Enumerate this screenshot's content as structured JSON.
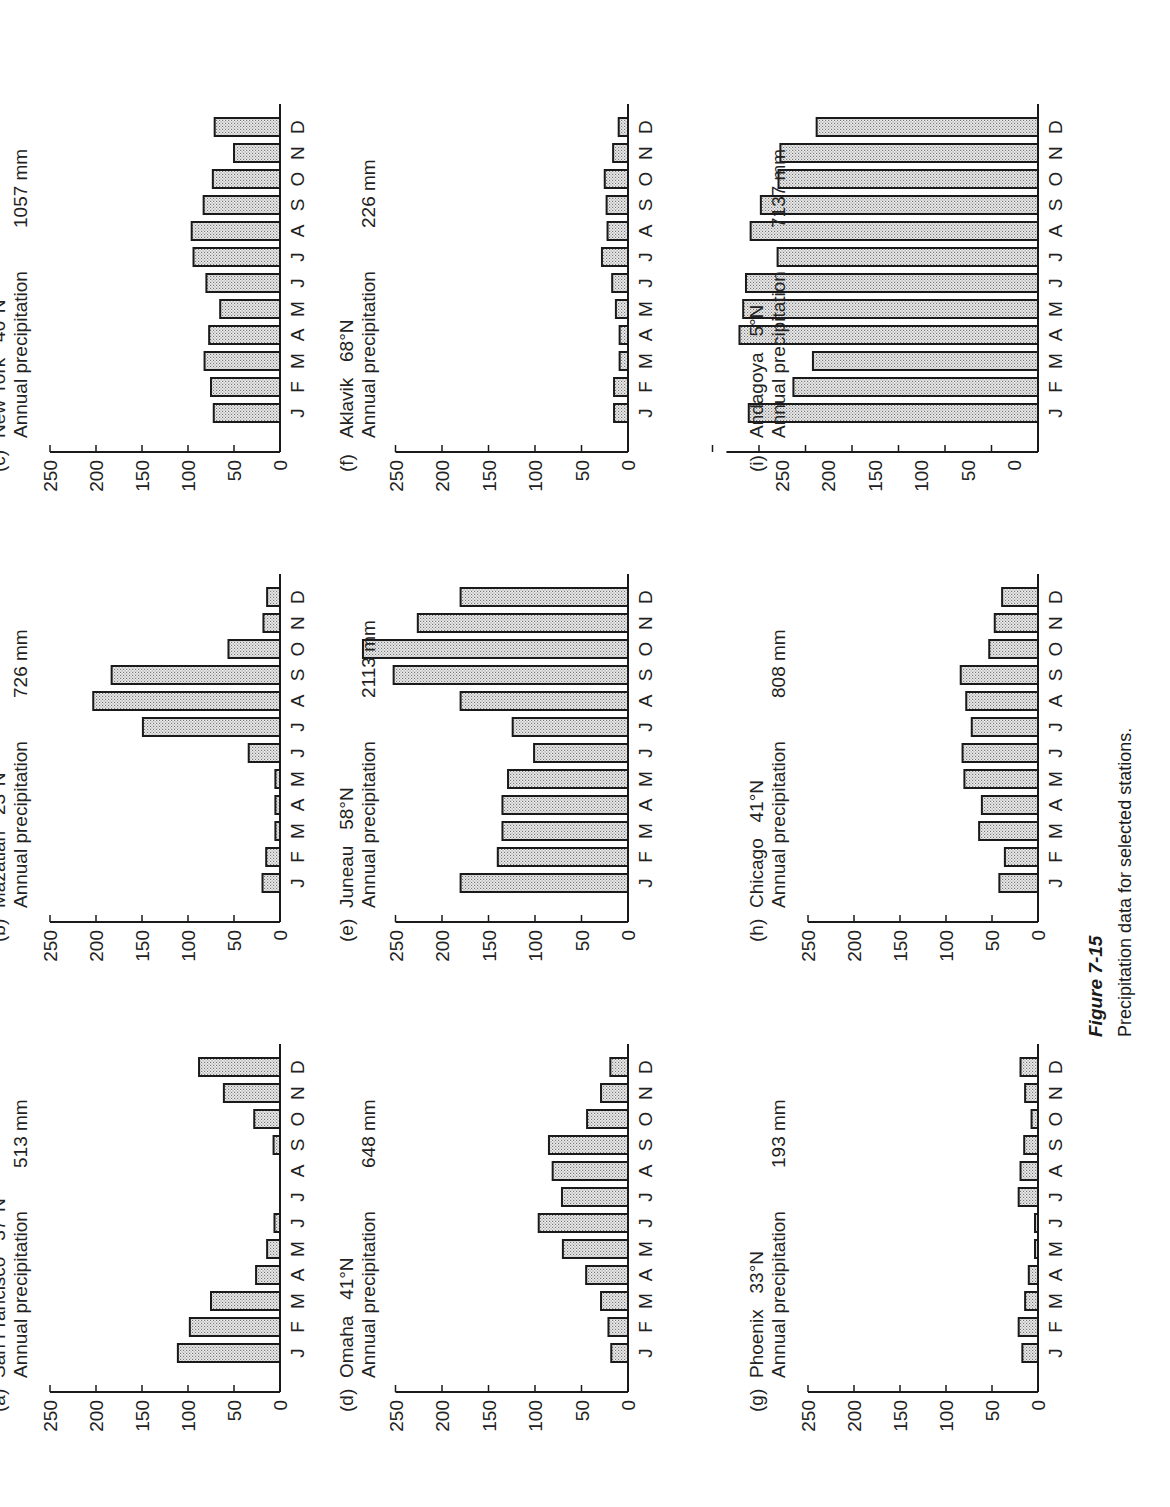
{
  "figure": {
    "title": "Figure 7-15",
    "caption": "Precipitation data for selected stations.",
    "orientation": "page rotated 90° counter-clockwise"
  },
  "months": [
    "J",
    "F",
    "M",
    "A",
    "M",
    "J",
    "J",
    "A",
    "S",
    "O",
    "N",
    "D"
  ],
  "axis_ticks": [
    "0",
    "50",
    "100",
    "150",
    "200",
    "250"
  ],
  "colors": {
    "bar_fill": "#d9d9d9",
    "bar_stroke": "#1a1a1a",
    "axis": "#1a1a1a"
  },
  "panels": [
    {
      "id": "a",
      "letter": "(a)",
      "station": "San Francisco",
      "latitude": "37°N",
      "annual_label": "Annual precipitation",
      "annual_total": "513 mm"
    },
    {
      "id": "b",
      "letter": "(b)",
      "station": "Mazatlan",
      "latitude": "23°N",
      "annual_label": "Annual precipitation",
      "annual_total": "726 mm"
    },
    {
      "id": "c",
      "letter": "(c)",
      "station": "New York",
      "latitude": "40°N",
      "annual_label": "Annual precipitation",
      "annual_total": "1057 mm"
    },
    {
      "id": "d",
      "letter": "(d)",
      "station": "Omaha",
      "latitude": "41°N",
      "annual_label": "Annual precipitation",
      "annual_total": "648 mm"
    },
    {
      "id": "e",
      "letter": "(e)",
      "station": "Juneau",
      "latitude": "58°N",
      "annual_label": "Annual precipitation",
      "annual_total": "2113 mm"
    },
    {
      "id": "f",
      "letter": "(f)",
      "station": "Aklavik",
      "latitude": "68°N",
      "annual_label": "Annual precipitation",
      "annual_total": "226 mm"
    },
    {
      "id": "g",
      "letter": "(g)",
      "station": "Phoenix",
      "latitude": "33°N",
      "annual_label": "Annual precipitation",
      "annual_total": "193 mm"
    },
    {
      "id": "h",
      "letter": "(h)",
      "station": "Chicago",
      "latitude": "41°N",
      "annual_label": "Annual precipitation",
      "annual_total": "808 mm"
    },
    {
      "id": "i",
      "letter": "(i)",
      "station": "Andagoya",
      "latitude": "5°N",
      "annual_label": "Annual precipitation",
      "annual_total": "7137 mm"
    }
  ],
  "chart_data": [
    {
      "type": "bar",
      "title": "(a) San Francisco 37°N — Annual precipitation 513 mm",
      "xlabel": "",
      "ylabel": "mm",
      "categories": [
        "J",
        "F",
        "M",
        "A",
        "M",
        "J",
        "J",
        "A",
        "S",
        "O",
        "N",
        "D"
      ],
      "values": [
        111,
        98,
        75,
        26,
        14,
        6,
        0,
        0,
        7,
        28,
        61,
        88
      ],
      "yticks": [
        0,
        50,
        100,
        150,
        200,
        250
      ],
      "ylim": [
        0,
        250
      ],
      "grid": false
    },
    {
      "type": "bar",
      "title": "(b) Mazatlan 23°N — Annual precipitation 726 mm",
      "xlabel": "",
      "ylabel": "mm",
      "categories": [
        "J",
        "F",
        "M",
        "A",
        "M",
        "J",
        "J",
        "A",
        "S",
        "O",
        "N",
        "D"
      ],
      "values": [
        19,
        15,
        5,
        5,
        5,
        34,
        149,
        203,
        183,
        56,
        18,
        14
      ],
      "yticks": [
        0,
        50,
        100,
        150,
        200,
        250
      ],
      "ylim": [
        0,
        250
      ],
      "grid": false
    },
    {
      "type": "bar",
      "title": "(c) New York 40°N — Annual precipitation 1057 mm",
      "xlabel": "",
      "ylabel": "mm",
      "categories": [
        "J",
        "F",
        "M",
        "A",
        "M",
        "J",
        "J",
        "A",
        "S",
        "O",
        "N",
        "D"
      ],
      "values": [
        72,
        75,
        82,
        77,
        65,
        80,
        94,
        96,
        83,
        73,
        50,
        71
      ],
      "yticks": [
        0,
        50,
        100,
        150,
        200,
        250
      ],
      "ylim": [
        0,
        250
      ],
      "grid": false
    },
    {
      "type": "bar",
      "title": "(d) Omaha 41°N — Annual precipitation 648 mm",
      "xlabel": "",
      "ylabel": "mm",
      "categories": [
        "J",
        "F",
        "M",
        "A",
        "M",
        "J",
        "J",
        "A",
        "S",
        "O",
        "N",
        "D"
      ],
      "values": [
        18,
        21,
        29,
        45,
        70,
        96,
        71,
        81,
        85,
        44,
        29,
        19
      ],
      "yticks": [
        0,
        50,
        100,
        150,
        200,
        250
      ],
      "ylim": [
        0,
        250
      ],
      "grid": false
    },
    {
      "type": "bar",
      "title": "(e) Juneau 58°N — Annual precipitation 2113 mm",
      "xlabel": "",
      "ylabel": "mm",
      "categories": [
        "J",
        "F",
        "M",
        "A",
        "M",
        "J",
        "J",
        "A",
        "S",
        "O",
        "N",
        "D"
      ],
      "values": [
        180,
        140,
        135,
        135,
        129,
        101,
        124,
        180,
        252,
        285,
        226,
        180
      ],
      "yticks": [
        0,
        50,
        100,
        150,
        200,
        250
      ],
      "ylim": [
        0,
        250
      ],
      "grid": false
    },
    {
      "type": "bar",
      "title": "(f) Aklavik 68°N — Annual precipitation 226 mm",
      "xlabel": "",
      "ylabel": "mm",
      "categories": [
        "J",
        "F",
        "M",
        "A",
        "M",
        "J",
        "J",
        "A",
        "S",
        "O",
        "N",
        "D"
      ],
      "values": [
        15,
        15,
        9,
        9,
        13,
        17,
        28,
        22,
        23,
        25,
        16,
        10
      ],
      "yticks": [
        0,
        50,
        100,
        150,
        200,
        250
      ],
      "ylim": [
        0,
        250
      ],
      "grid": false
    },
    {
      "type": "bar",
      "title": "(g) Phoenix 33°N — Annual precipitation 193 mm",
      "xlabel": "",
      "ylabel": "mm",
      "categories": [
        "J",
        "F",
        "M",
        "A",
        "M",
        "J",
        "J",
        "A",
        "S",
        "O",
        "N",
        "D"
      ],
      "values": [
        17,
        21,
        14,
        10,
        3,
        2,
        21,
        19,
        15,
        7,
        14,
        19
      ],
      "yticks": [
        0,
        50,
        100,
        150,
        200,
        250
      ],
      "ylim": [
        0,
        250
      ],
      "grid": false
    },
    {
      "type": "bar",
      "title": "(h) Chicago 41°N — Annual precipitation 808 mm",
      "xlabel": "",
      "ylabel": "mm",
      "categories": [
        "J",
        "F",
        "M",
        "A",
        "M",
        "J",
        "J",
        "A",
        "S",
        "O",
        "N",
        "D"
      ],
      "values": [
        42,
        36,
        64,
        61,
        80,
        82,
        72,
        78,
        84,
        53,
        47,
        39
      ],
      "yticks": [
        0,
        50,
        100,
        150,
        200,
        250
      ],
      "ylim": [
        0,
        250
      ],
      "grid": false
    },
    {
      "type": "bar",
      "title": "(i) Andagoya 5°N — Annual precipitation 7137 mm",
      "xlabel": "",
      "ylabel": "mm (axis as printed)",
      "categories": [
        "J",
        "F",
        "M",
        "A",
        "M",
        "J",
        "J",
        "A",
        "S",
        "O",
        "N",
        "D"
      ],
      "values": [
        311,
        263,
        242,
        321,
        317,
        314,
        280,
        309,
        298,
        279,
        277,
        238
      ],
      "yticks": [
        0,
        50,
        100,
        150,
        200,
        250
      ],
      "ylim": [
        0,
        350
      ],
      "grid": false
    }
  ]
}
